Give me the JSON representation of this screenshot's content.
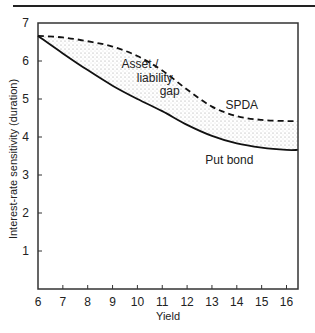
{
  "chart_data": {
    "type": "line",
    "title": "",
    "xlabel": "Yield",
    "ylabel": "Interest-rate sensitivity (duration)",
    "xlim": [
      6,
      16.45
    ],
    "ylim": [
      0,
      7
    ],
    "xticks": [
      "6",
      "7",
      "8",
      "9",
      "10",
      "11",
      "12",
      "13",
      "14",
      "15",
      "16"
    ],
    "yticks": [
      "1",
      "2",
      "3",
      "4",
      "5",
      "6",
      "7"
    ],
    "grid": false,
    "series": [
      {
        "name": "SPDA",
        "style": "dashed",
        "x": [
          6,
          7,
          8,
          9,
          10,
          11,
          12,
          13,
          14,
          15,
          16,
          16.45
        ],
        "y": [
          6.66,
          6.62,
          6.52,
          6.38,
          6.13,
          5.75,
          5.25,
          4.8,
          4.55,
          4.45,
          4.42,
          4.42
        ]
      },
      {
        "name": "Put bond",
        "style": "solid",
        "x": [
          6,
          7,
          8,
          9,
          10,
          11,
          12,
          13,
          14,
          15,
          16,
          16.45
        ],
        "y": [
          6.66,
          6.2,
          5.76,
          5.35,
          5.0,
          4.68,
          4.32,
          4.03,
          3.83,
          3.72,
          3.66,
          3.66
        ]
      }
    ],
    "annotations": [
      {
        "text": "Asset /",
        "x": 10.1,
        "y": 5.82
      },
      {
        "text": "liability",
        "x": 10.7,
        "y": 5.45
      },
      {
        "text": "gap",
        "x": 11.3,
        "y": 5.1
      },
      {
        "text": "SPDA",
        "x": 14.2,
        "y": 4.75
      },
      {
        "text": "Put bond",
        "x": 13.7,
        "y": 3.3
      }
    ],
    "shaded_region": "between SPDA and Put bond (Asset / liability gap)"
  }
}
